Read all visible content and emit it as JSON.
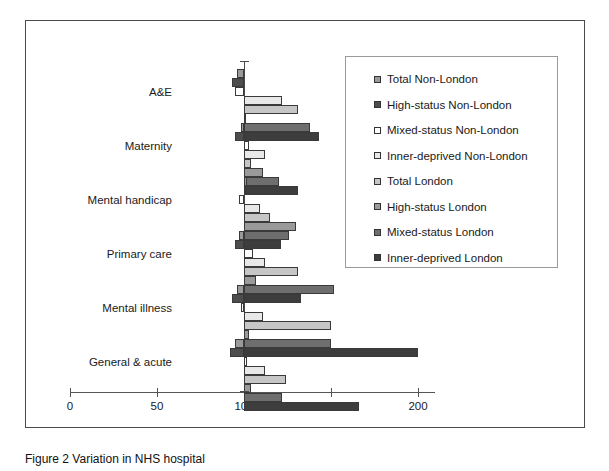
{
  "figure": {
    "caption": "Figure 2 Variation in NHS hospital"
  },
  "chart_data": {
    "type": "bar",
    "orientation": "horizontal",
    "title": "",
    "xlabel": "",
    "ylabel": "",
    "xlim": [
      0,
      210
    ],
    "xticks": [
      0,
      50,
      100,
      150,
      200
    ],
    "xtick_labels": [
      "0",
      "50",
      "100",
      "150",
      "200"
    ],
    "baseline": 100,
    "grid": false,
    "legend_position": "top-right",
    "categories": [
      "A&E",
      "Maternity",
      "Mental handicap",
      "Primary care",
      "Mental illness",
      "General & acute"
    ],
    "series": [
      {
        "name": "Total  Non-London",
        "fill": "#9a9a9a",
        "values": [
          96,
          98,
          102,
          97,
          96,
          95
        ]
      },
      {
        "name": "High-status  Non-London",
        "fill": "#4d4d4d",
        "values": [
          93,
          95,
          100,
          95,
          93,
          92
        ]
      },
      {
        "name": "Mixed-status  Non-London",
        "fill": "#ffffff",
        "values": [
          95,
          103,
          97,
          105,
          98,
          102
        ]
      },
      {
        "name": "Inner-deprived  Non-London",
        "fill": "#e8e8e8",
        "values": [
          122,
          112,
          109,
          112,
          111,
          112
        ]
      },
      {
        "name": "Total  London",
        "fill": "#c6c6c6",
        "values": [
          131,
          104,
          115,
          131,
          150,
          124
        ]
      },
      {
        "name": "High-status  London",
        "fill": "#9a9a9a",
        "values": [
          100,
          111,
          130,
          107,
          103,
          104
        ]
      },
      {
        "name": "Mixed-status  London",
        "fill": "#6e6e6e",
        "values": [
          138,
          120,
          126,
          152,
          150,
          122
        ]
      },
      {
        "name": "Inner-deprived  London",
        "fill": "#3d3d3d",
        "values": [
          143,
          131,
          121,
          133,
          200,
          166
        ]
      }
    ]
  }
}
